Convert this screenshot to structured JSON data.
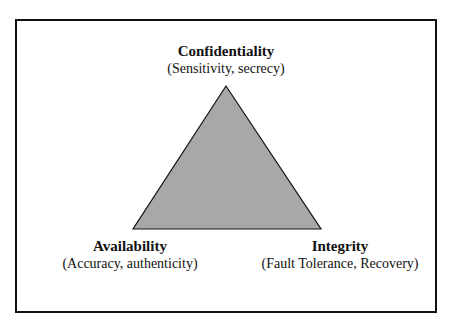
{
  "diagram": {
    "type": "triangle",
    "fill_color": "#a8a8a8",
    "vertices": [
      {
        "title": "Confidentiality",
        "subtitle": "(Sensitivity, secrecy)",
        "position": "top"
      },
      {
        "title": "Availability",
        "subtitle": "(Accuracy, authenticity)",
        "position": "bottom-left"
      },
      {
        "title": "Integrity",
        "subtitle": "(Fault Tolerance, Recovery)",
        "position": "bottom-right"
      }
    ]
  }
}
